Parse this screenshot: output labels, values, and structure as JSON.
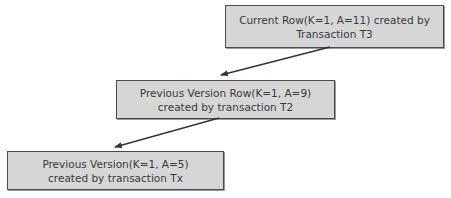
{
  "diagram": {
    "type": "row-version-chain",
    "nodes": [
      {
        "id": "current",
        "line1": "Current Row(K=1, A=11) created by",
        "line2": "Transaction T3"
      },
      {
        "id": "previous",
        "line1": "Previous Version Row(K=1, A=9)",
        "line2": "created by transaction T2"
      },
      {
        "id": "oldest",
        "line1": "Previous Version(K=1, A=5)",
        "line2": "created by transaction Tx"
      }
    ],
    "edges": [
      {
        "from": "current",
        "to": "previous"
      },
      {
        "from": "previous",
        "to": "oldest"
      }
    ],
    "colors": {
      "box_fill": "#d6d6d6",
      "box_border": "#4a4a4a",
      "text": "#3a3a3a",
      "arrow": "#333333"
    }
  }
}
